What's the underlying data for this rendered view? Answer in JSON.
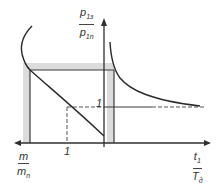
{
  "diagram": {
    "y_axis_label": {
      "numerator": "p",
      "numerator_sub": "1з",
      "denominator": "p",
      "denominator_sub": "1n"
    },
    "x_axis_left_label": {
      "numerator": "m",
      "numerator_sub": "",
      "denominator": "m",
      "denominator_sub": "n"
    },
    "x_axis_right_label": {
      "numerator": "t",
      "numerator_sub": "1",
      "denominator": "T",
      "denominator_sub": "д"
    },
    "tick_x_one": "1",
    "tick_y_one": "1",
    "colors": {
      "line": "#2f2f2f",
      "band": "#d9d9d9"
    }
  }
}
